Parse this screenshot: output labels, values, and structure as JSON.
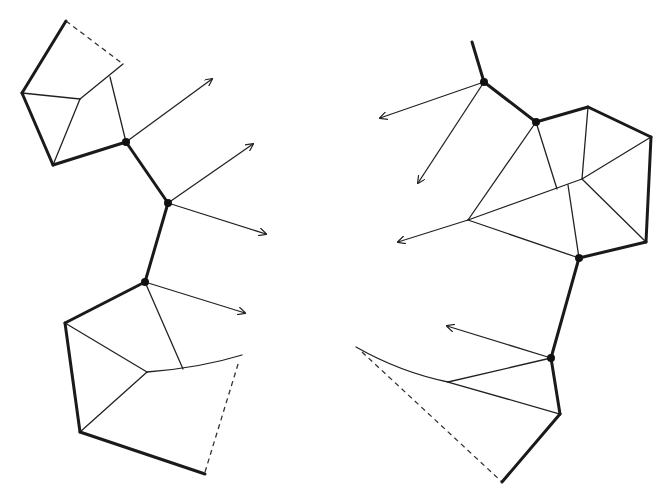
{
  "diagram": {
    "width": 663,
    "height": 493,
    "colors": {
      "stroke": "#1a1a1a",
      "background": "#ffffff"
    },
    "left_structure": {
      "nodes": [
        [
          126,
          142
        ],
        [
          168,
          203
        ],
        [
          145,
          282
        ]
      ],
      "thick_edges": [
        [
          [
            66,
            21
          ],
          [
            22,
            93
          ]
        ],
        [
          [
            22,
            93
          ],
          [
            53,
            165
          ]
        ],
        [
          [
            53,
            165
          ],
          [
            126,
            142
          ]
        ],
        [
          [
            126,
            142
          ],
          [
            168,
            203
          ]
        ],
        [
          [
            168,
            203
          ],
          [
            145,
            282
          ]
        ],
        [
          [
            145,
            282
          ],
          [
            65,
            323
          ]
        ],
        [
          [
            65,
            323
          ],
          [
            80,
            432
          ]
        ],
        [
          [
            80,
            432
          ],
          [
            205,
            474
          ]
        ]
      ],
      "thin_edges": [
        [
          [
            22,
            93
          ],
          [
            80,
            99
          ]
        ],
        [
          [
            80,
            99
          ],
          [
            53,
            165
          ]
        ],
        [
          [
            80,
            99
          ],
          [
            123,
            64
          ]
        ],
        [
          [
            110,
            77
          ],
          [
            126,
            142
          ]
        ],
        [
          [
            145,
            282
          ],
          [
            183,
            369
          ]
        ],
        [
          [
            65,
            323
          ],
          [
            147,
            372
          ]
        ],
        [
          [
            147,
            372
          ],
          [
            80,
            432
          ]
        ]
      ],
      "curves": [
        "M147,372 Q200,368 242,355"
      ],
      "dashed_edges": [
        [
          [
            66,
            21
          ],
          [
            123,
            64
          ]
        ],
        [
          [
            205,
            472
          ],
          [
            239,
            361
          ]
        ]
      ],
      "arrows": [
        [
          [
            126,
            142
          ],
          [
            212,
            79
          ]
        ],
        [
          [
            168,
            203
          ],
          [
            253,
            144
          ]
        ],
        [
          [
            168,
            203
          ],
          [
            266,
            234
          ]
        ],
        [
          [
            145,
            282
          ],
          [
            245,
            313
          ]
        ]
      ]
    },
    "right_structure": {
      "nodes": [
        [
          484,
          82
        ],
        [
          536,
          122
        ],
        [
          579,
          258
        ],
        [
          551,
          358
        ]
      ],
      "thick_edges": [
        [
          [
            472,
            42
          ],
          [
            484,
            82
          ]
        ],
        [
          [
            484,
            82
          ],
          [
            536,
            122
          ]
        ],
        [
          [
            536,
            122
          ],
          [
            588,
            107
          ]
        ],
        [
          [
            588,
            107
          ],
          [
            651,
            137
          ]
        ],
        [
          [
            651,
            137
          ],
          [
            646,
            242
          ]
        ],
        [
          [
            646,
            242
          ],
          [
            579,
            258
          ]
        ],
        [
          [
            579,
            258
          ],
          [
            551,
            358
          ]
        ],
        [
          [
            551,
            358
          ],
          [
            560,
            414
          ]
        ],
        [
          [
            560,
            414
          ],
          [
            502,
            482
          ]
        ]
      ],
      "thin_edges": [
        [
          [
            588,
            107
          ],
          [
            582,
            179
          ]
        ],
        [
          [
            651,
            137
          ],
          [
            582,
            179
          ]
        ],
        [
          [
            582,
            179
          ],
          [
            468,
            220
          ]
        ],
        [
          [
            536,
            122
          ],
          [
            468,
            220
          ]
        ],
        [
          [
            536,
            122
          ],
          [
            557,
            189
          ]
        ],
        [
          [
            568,
            185
          ],
          [
            579,
            258
          ]
        ],
        [
          [
            582,
            179
          ],
          [
            646,
            242
          ]
        ],
        [
          [
            468,
            220
          ],
          [
            579,
            258
          ]
        ],
        [
          [
            448,
            382
          ],
          [
            551,
            358
          ]
        ],
        [
          [
            448,
            382
          ],
          [
            560,
            414
          ]
        ]
      ],
      "curves": [
        "M356,347 Q400,372 448,382"
      ],
      "dashed_edges": [
        [
          [
            362,
            352
          ],
          [
            502,
            482
          ]
        ]
      ],
      "arrows": [
        [
          [
            484,
            82
          ],
          [
            380,
            118
          ]
        ],
        [
          [
            484,
            82
          ],
          [
            418,
            183
          ]
        ],
        [
          [
            468,
            220
          ],
          [
            398,
            242
          ]
        ],
        [
          [
            551,
            358
          ],
          [
            447,
            326
          ]
        ]
      ]
    }
  }
}
